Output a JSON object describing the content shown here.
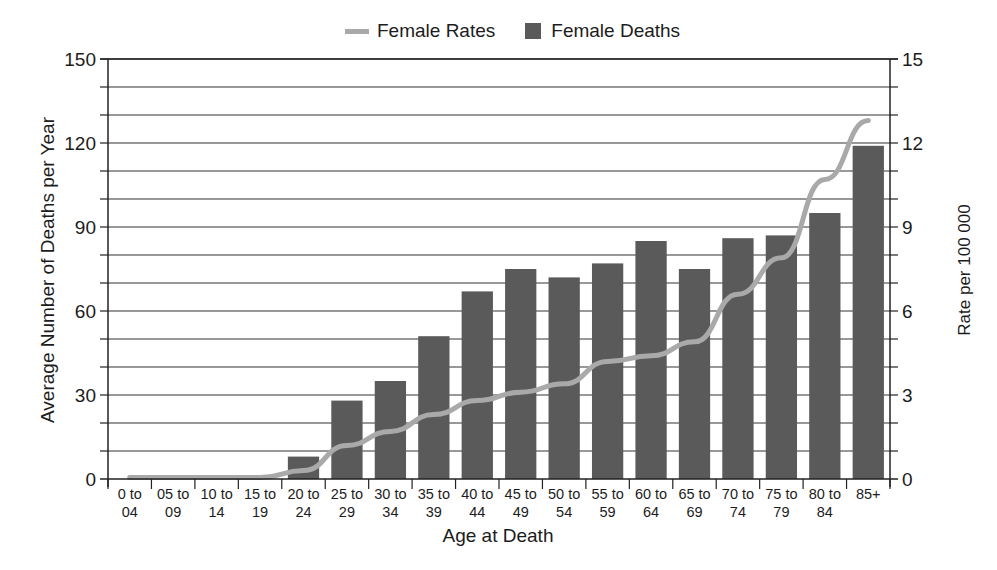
{
  "chart_data": {
    "type": "bar",
    "title": "",
    "xlabel": "Age at Death",
    "ylabel": "Average Number of Deaths per Year",
    "y2label": "Rate per 100 000",
    "ylim": [
      0,
      150
    ],
    "y2lim": [
      0,
      15
    ],
    "yticks": [
      0,
      30,
      60,
      90,
      120,
      150
    ],
    "y2ticks": [
      0,
      3,
      6,
      9,
      12,
      15
    ],
    "grid": true,
    "legend_position": "top",
    "categories": [
      "0 to 04",
      "05 to 09",
      "10 to 14",
      "15 to 19",
      "20 to 24",
      "25 to 29",
      "30 to 34",
      "35 to 39",
      "40 to 44",
      "45 to 49",
      "50 to 54",
      "55 to 59",
      "60 to 64",
      "65 to 69",
      "70 to 74",
      "75 to 79",
      "80 to 84",
      "85+"
    ],
    "category_lines": [
      [
        "0 to",
        "04"
      ],
      [
        "05 to",
        "09"
      ],
      [
        "10 to",
        "14"
      ],
      [
        "15 to",
        "19"
      ],
      [
        "20 to",
        "24"
      ],
      [
        "25 to",
        "29"
      ],
      [
        "30 to",
        "34"
      ],
      [
        "35 to",
        "39"
      ],
      [
        "40 to",
        "44"
      ],
      [
        "45 to",
        "49"
      ],
      [
        "50 to",
        "54"
      ],
      [
        "55 to",
        "59"
      ],
      [
        "60 to",
        "64"
      ],
      [
        "65 to",
        "69"
      ],
      [
        "70 to",
        "74"
      ],
      [
        "75 to",
        "79"
      ],
      [
        "80 to",
        "84"
      ],
      [
        "85+",
        ""
      ]
    ],
    "series": [
      {
        "name": "Female Deaths",
        "type": "bar",
        "axis": "left",
        "color": "#5a5a5a",
        "values": [
          0,
          0,
          0,
          0,
          8,
          28,
          35,
          51,
          67,
          75,
          72,
          77,
          85,
          75,
          86,
          87,
          95,
          119
        ]
      },
      {
        "name": "Female Rates",
        "type": "line",
        "axis": "right",
        "color": "#a9a9a9",
        "values": [
          0.05,
          0.05,
          0.05,
          0.05,
          0.3,
          1.2,
          1.7,
          2.3,
          2.8,
          3.1,
          3.4,
          4.2,
          4.4,
          4.9,
          6.6,
          7.9,
          10.7,
          12.8
        ]
      }
    ]
  },
  "legend": {
    "items": [
      {
        "label": "Female Rates",
        "icon": "line-swatch"
      },
      {
        "label": "Female Deaths",
        "icon": "bar-swatch"
      }
    ]
  },
  "axes": {
    "left_title": "Average Number of Deaths per Year",
    "right_title": "Rate per 100 000",
    "x_title": "Age at Death"
  },
  "colors": {
    "bar": "#5a5a5a",
    "line": "#a9a9a9",
    "axis": "#222222",
    "grid": "#333333"
  }
}
